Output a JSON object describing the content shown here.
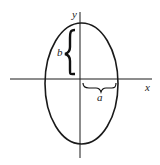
{
  "diagram": {
    "axes": {
      "x_label": "x",
      "y_label": "y"
    },
    "ellipse": {
      "semi_major_label": "b",
      "semi_minor_label": "a",
      "orientation": "vertical"
    },
    "colors": {
      "stroke": "#1a1a1a",
      "background": "#ffffff"
    }
  }
}
